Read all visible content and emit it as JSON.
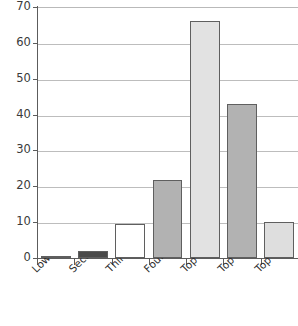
{
  "chart_data": {
    "type": "bar",
    "title": "",
    "subtitle": "",
    "xlabel": "",
    "ylabel": "",
    "categories": [
      "Lowest quintile",
      "Second quintile",
      "Third quintile",
      "Fourth quintile",
      "Top quintile",
      "Top 10%",
      "Top 1%"
    ],
    "values": [
      0.2,
      2,
      9.5,
      21.7,
      66,
      43,
      10
    ],
    "bar_colors": [
      "#8f8f8f",
      "#4a4a4a",
      "#ffffff",
      "#b2b2b2",
      "#e2e2e2",
      "#b2b2b2",
      "#dedede"
    ],
    "bar_edge_color": "#5f5f5f",
    "ylim": [
      0,
      70
    ],
    "yticks": [
      0,
      10,
      20,
      30,
      40,
      50,
      60,
      70
    ],
    "ytick_labels": [
      "0",
      "10",
      "20",
      "30",
      "40",
      "50",
      "60",
      "70"
    ],
    "grid": "horizontal",
    "grid_color": "#bdbdbd",
    "legend": "none",
    "axis_color": "#5c5c5c",
    "background": "#ffffff",
    "xtick_label_rotation": -45
  }
}
